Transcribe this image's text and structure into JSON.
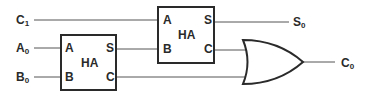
{
  "diagram": {
    "type": "logic-circuit",
    "colors": {
      "line": "#2a2a2a",
      "wire": "#555555",
      "background": "#ffffff"
    },
    "inputs": [
      {
        "id": "c1",
        "main": "C",
        "sub": "1"
      },
      {
        "id": "a0",
        "main": "A",
        "sub": "0"
      },
      {
        "id": "b0",
        "main": "B",
        "sub": "0"
      }
    ],
    "outputs": [
      {
        "id": "s0",
        "main": "S",
        "sub": "0"
      },
      {
        "id": "c0",
        "main": "C",
        "sub": "0"
      }
    ],
    "half_adder_1": {
      "label": "HA",
      "pin_a": "A",
      "pin_b": "B",
      "pin_s": "S",
      "pin_c": "C"
    },
    "half_adder_2": {
      "label": "HA",
      "pin_a": "A",
      "pin_b": "B",
      "pin_s": "S",
      "pin_c": "C"
    },
    "or_gate": {
      "label": "OR"
    },
    "connections": [
      "C1 -> HA2.A",
      "A0 -> HA1.A",
      "B0 -> HA1.B",
      "HA1.S -> HA2.B",
      "HA2.S -> S0",
      "HA2.C -> OR.in1",
      "HA1.C -> OR.in2",
      "OR.out -> C0"
    ]
  }
}
